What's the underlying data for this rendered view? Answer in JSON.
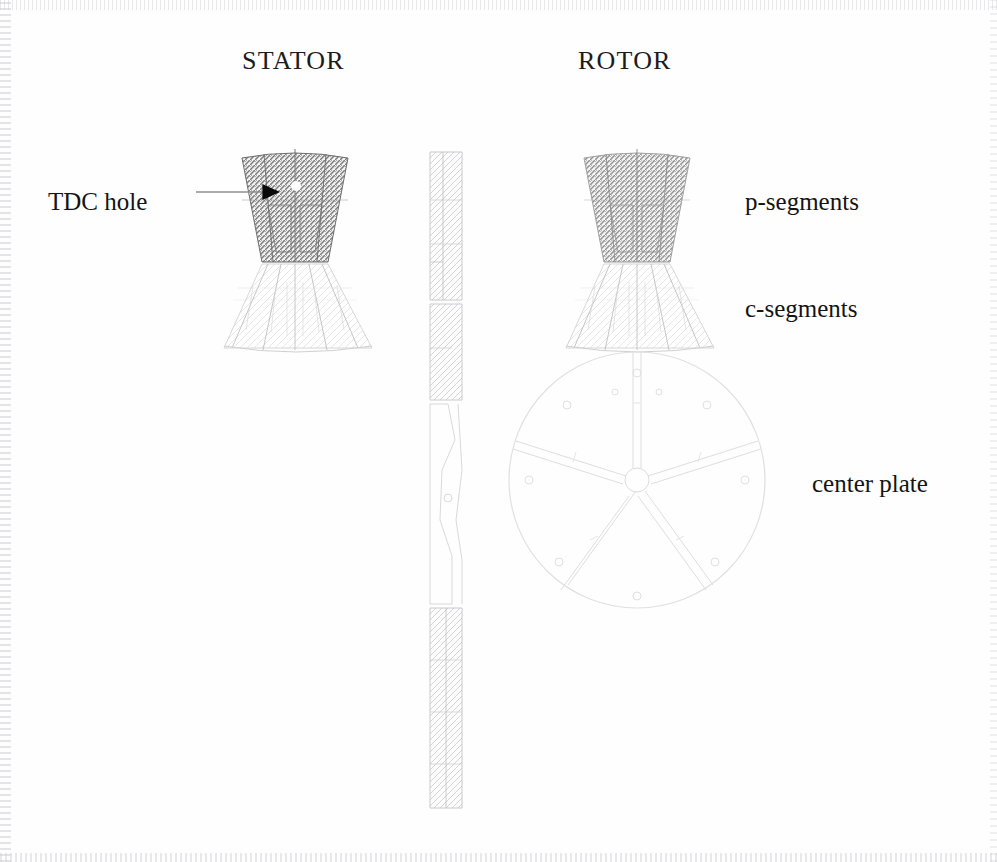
{
  "figure": {
    "type": "engineering-assembly-drawing",
    "headings": [
      {
        "label": "STATOR",
        "x": 242,
        "y": 60
      },
      {
        "label": "ROTOR",
        "x": 578,
        "y": 60
      }
    ],
    "callouts": [
      {
        "name": "tdc-hole",
        "label": "TDC hole",
        "x": 48,
        "y": 188,
        "leader": true,
        "arrow": true
      },
      {
        "name": "p-segments",
        "label": "p-segments",
        "x": 745,
        "y": 188,
        "leader": false,
        "arrow": false
      },
      {
        "name": "c-segments",
        "label": "c-segments",
        "x": 745,
        "y": 295,
        "leader": false,
        "arrow": false
      },
      {
        "name": "center-plate",
        "label": "center plate",
        "x": 812,
        "y": 470,
        "leader": false,
        "arrow": false
      }
    ],
    "leader_line": {
      "x1": 196,
      "y1": 192,
      "x2": 262,
      "y2": 192
    },
    "arrow_head": {
      "x": 262,
      "y": 192,
      "size": 17
    },
    "tdc_hole_dot": {
      "x": 296,
      "y": 186,
      "r": 5
    },
    "stator": {
      "p_segment_block": {
        "cx": 295,
        "top_y": 152,
        "bottom_y": 262,
        "top_half_width": 53,
        "bottom_half_width": 33
      },
      "c_segment_fan": {
        "cx": 295,
        "top_y": 262,
        "bottom_y": 352,
        "blades": 5,
        "spread_deg": 58
      }
    },
    "rotor": {
      "p_segment_block": {
        "cx": 637,
        "top_y": 152,
        "bottom_y": 262,
        "top_half_width": 53,
        "bottom_half_width": 33
      },
      "c_segment_fan": {
        "cx": 637,
        "top_y": 262,
        "bottom_y": 352,
        "blades": 5,
        "spread_deg": 58
      },
      "center_plate": {
        "cx": 637,
        "cy": 480,
        "r": 128,
        "spokes": 5,
        "hub_r": 12,
        "bolt_holes": 10
      }
    },
    "side_view": {
      "x": 428,
      "top_y": 150,
      "bottom_y": 808,
      "width": 34
    },
    "colors": {
      "background": "#fefefe",
      "text": "#141414",
      "heavy_line": "#1c1c1c",
      "hatch_dark": "#8a8a8a",
      "hatch_light": "#cfcfcf",
      "faint_line": "#e2e2e4"
    }
  }
}
